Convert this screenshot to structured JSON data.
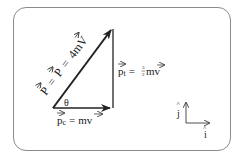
{
  "diagram": {
    "labels": {
      "hypotenuse": "P = P = 4mV",
      "hypotenuse_parts": [
        "P",
        "=",
        "P",
        "=",
        "4m",
        "V"
      ],
      "vertical": "p_t = 3/2 mv",
      "vertical_parts": {
        "symbol": "p",
        "subscript": "t",
        "eq": "=",
        "num": "3",
        "den": "2",
        "rest": "mv"
      },
      "horizontal": "p_c = mv",
      "horizontal_parts": {
        "symbol": "p",
        "subscript": "c",
        "eq": "=",
        "rest": "mv"
      },
      "angle": "θ",
      "axis_j": "j",
      "axis_i": "i"
    },
    "colors": {
      "stroke": "#222222",
      "border": "#8a8a8a",
      "background": "#ffffff"
    }
  }
}
